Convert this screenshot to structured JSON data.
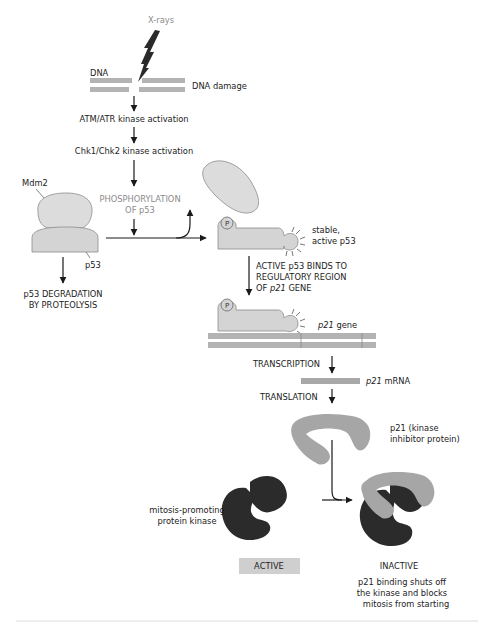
{
  "colors": {
    "protein_light": "#dcdcdc",
    "protein_outline": "#8c8c8c",
    "dna": "#b3b3b3",
    "p21": "#a6a6a6",
    "kinase": "#2b2b2b",
    "arrow": "#1a1a1a",
    "status_box": "#cfcfcf",
    "gray_text": "#8a8a8a"
  },
  "labels": {
    "xrays": "X-rays",
    "dna": "DNA",
    "dna_damage": "DNA damage",
    "atm_atr": "ATM/ATR kinase activation",
    "chk": "Chk1/Chk2 kinase activation",
    "mdm2": "Mdm2",
    "phosphorylation_line1": "PHOSPHORYLATION",
    "phosphorylation_line2": "OF p53",
    "p53": "p53",
    "degradation_line1": "p53 DEGRADATION",
    "degradation_line2": "BY PROTEOLYSIS",
    "phospho_p": "P",
    "stable_line1": "stable,",
    "stable_line2": "active p53",
    "binds_line1": "ACTIVE p53 BINDS TO",
    "binds_line2": "REGULATORY REGION",
    "binds_line3_pre": "OF ",
    "binds_line3_italic": "p21",
    "binds_line3_post": " GENE",
    "gene_italic": "p21",
    "gene_suffix": " gene",
    "transcription": "TRANSCRIPTION",
    "mrna_italic": "p21",
    "mrna_suffix": " mRNA",
    "translation": "TRANSLATION",
    "p21_line1": "p21 (kinase",
    "p21_line2": "inhibitor protein)",
    "kinase_line1": "mitosis-promoting",
    "kinase_line2": "protein kinase",
    "active": "ACTIVE",
    "inactive": "INACTIVE",
    "caption_line1": "p21 binding shuts off",
    "caption_line2": "the kinase and blocks",
    "caption_line3": "mitosis from starting"
  }
}
